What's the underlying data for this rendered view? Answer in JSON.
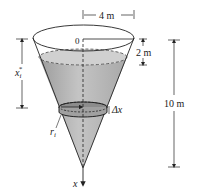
{
  "diagram": {
    "type": "conical-tank-work-problem",
    "labels": {
      "top_radius": "4 m",
      "origin": "0",
      "empty_depth": "2 m",
      "height": "10 m",
      "slice_depth": "x",
      "slice_depth_sup": "*",
      "slice_depth_sub": "i",
      "slice_radius": "r",
      "slice_radius_sub": "i",
      "slice_thickness": "Δx",
      "axis": "x"
    },
    "colors": {
      "line": "#222222",
      "water": "#b8b8b8",
      "water_dark": "#9a9a9a",
      "background": "#ffffff"
    }
  }
}
